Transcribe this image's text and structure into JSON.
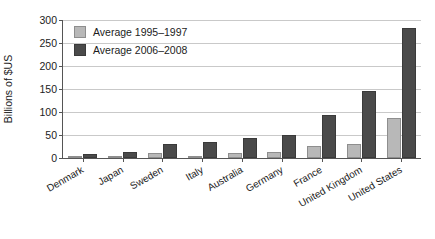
{
  "chart_data": {
    "type": "bar",
    "title": "",
    "subtitle": "",
    "xlabel": "",
    "ylabel": "Billions of $US",
    "ylim": [
      0,
      300
    ],
    "yticks": [
      0,
      50,
      100,
      150,
      200,
      250,
      300
    ],
    "ytick_labels": [
      "0",
      "50",
      "100",
      "150",
      "200",
      "250",
      "300"
    ],
    "grid": "horizontal",
    "legend_position": "top-left-inside",
    "categories": [
      "Denmark",
      "Japan",
      "Sweden",
      "Italy",
      "Australia",
      "Germany",
      "France",
      "United Kingdom",
      "United States"
    ],
    "series": [
      {
        "name": "Average 1995–1997",
        "color": "#b8b8b8",
        "values": [
          2,
          3,
          11,
          5,
          11,
          12,
          26,
          31,
          87
        ]
      },
      {
        "name": "Average 2006–2008",
        "color": "#4a4a4a",
        "values": [
          9,
          14,
          31,
          35,
          43,
          50,
          94,
          146,
          283
        ]
      }
    ],
    "annotations": []
  }
}
